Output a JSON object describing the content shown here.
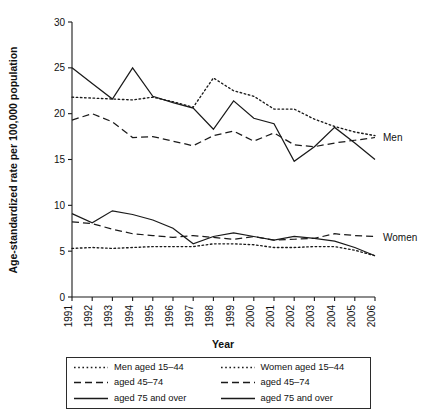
{
  "chart_data": {
    "type": "line",
    "title": "",
    "xlabel": "Year",
    "ylabel": "Age-standardized rate per 100,000 population",
    "x": [
      1991,
      1992,
      1993,
      1994,
      1995,
      1996,
      1997,
      1998,
      1999,
      2000,
      2001,
      2002,
      2003,
      2004,
      2005,
      2006
    ],
    "xtick_labels": [
      "1991",
      "1992",
      "1993",
      "1994",
      "1995",
      "1996",
      "1997",
      "1998",
      "1999",
      "2000",
      "2001",
      "2002",
      "2003",
      "2004",
      "2005",
      "2006"
    ],
    "ytick_labels": [
      "0",
      "5",
      "10",
      "15",
      "20",
      "25",
      "30"
    ],
    "yticks": [
      0,
      5,
      10,
      15,
      20,
      25,
      30
    ],
    "ylim": [
      0,
      30
    ],
    "xlim": [
      1991,
      2006
    ],
    "grid": false,
    "legend_position": "below-axes",
    "group_labels": [
      {
        "name": "men-group-label",
        "text": "Men",
        "value_at_2006": 17.5
      },
      {
        "name": "women-group-label",
        "text": "Women",
        "value_at_2006": 6.6
      }
    ],
    "series": [
      {
        "name": "Men aged 15-44",
        "group": "Men",
        "style": "dotted",
        "values": [
          21.8,
          21.7,
          21.6,
          21.5,
          21.8,
          21.3,
          20.7,
          23.9,
          22.5,
          21.9,
          20.5,
          20.5,
          19.4,
          18.6,
          18.0,
          17.6
        ]
      },
      {
        "name": "Men aged 45-74",
        "group": "Men",
        "style": "dashed",
        "values": [
          19.3,
          20.0,
          19.1,
          17.4,
          17.5,
          17.0,
          16.5,
          17.6,
          18.1,
          17.0,
          17.9,
          16.6,
          16.4,
          16.8,
          17.1,
          17.4
        ]
      },
      {
        "name": "Men aged 75 and over",
        "group": "Men",
        "style": "solid",
        "values": [
          25.0,
          23.3,
          21.6,
          25.0,
          21.9,
          21.2,
          20.6,
          18.3,
          21.4,
          19.5,
          18.9,
          14.8,
          16.4,
          18.5,
          16.8,
          15.0
        ]
      },
      {
        "name": "Women aged 15-44",
        "group": "Women",
        "style": "dotted",
        "values": [
          5.3,
          5.4,
          5.3,
          5.4,
          5.5,
          5.5,
          5.5,
          5.8,
          5.8,
          5.7,
          5.4,
          5.4,
          5.5,
          5.5,
          5.1,
          4.5
        ]
      },
      {
        "name": "Women aged 45-74",
        "group": "Women",
        "style": "dashed",
        "values": [
          8.2,
          8.0,
          7.4,
          6.9,
          6.7,
          6.5,
          6.7,
          6.5,
          6.3,
          6.6,
          6.2,
          6.3,
          6.4,
          6.9,
          6.7,
          6.6
        ]
      },
      {
        "name": "Women aged 75 and over",
        "group": "Women",
        "style": "solid",
        "values": [
          9.1,
          8.1,
          9.4,
          9.0,
          8.4,
          7.5,
          5.8,
          6.6,
          7.0,
          6.6,
          6.2,
          6.6,
          6.4,
          6.1,
          5.4,
          4.5
        ]
      }
    ]
  },
  "legend": {
    "rows": [
      {
        "left_style": "dotted",
        "left_label": "Men aged 15–44",
        "right_style": "dotted",
        "right_label": "Women aged 15–44"
      },
      {
        "left_style": "dashed",
        "left_label": "aged 45–74",
        "right_style": "dashed",
        "right_label": "aged 45–74"
      },
      {
        "left_style": "solid",
        "left_label": "aged 75 and over",
        "right_style": "solid",
        "right_label": "aged 75 and over"
      }
    ]
  }
}
